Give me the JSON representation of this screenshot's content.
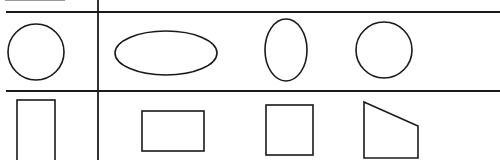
{
  "diagram": {
    "type": "shape-table",
    "colors": {
      "line": "#1a1a1a",
      "background": "#ffffff"
    },
    "grid": {
      "horizontal_lines": [
        {
          "x1": 6,
          "y": 12,
          "x2": 500
        },
        {
          "x1": 6,
          "y": 91,
          "x2": 500
        }
      ],
      "vertical_lines": [
        {
          "x": 98,
          "y1": 0,
          "y2": 160
        }
      ]
    },
    "rows": [
      {
        "name": "round-shapes",
        "shapes": [
          {
            "kind": "circle",
            "cx": 36,
            "cy": 52,
            "r": 28
          },
          {
            "kind": "ellipse-horizontal",
            "cx": 166,
            "cy": 53,
            "rx": 51,
            "ry": 22
          },
          {
            "kind": "ellipse-vertical",
            "cx": 286,
            "cy": 50,
            "rx": 21,
            "ry": 31
          },
          {
            "kind": "circle",
            "cx": 384,
            "cy": 50,
            "r": 28
          }
        ]
      },
      {
        "name": "angular-shapes",
        "shapes": [
          {
            "kind": "rectangle-tall",
            "x": 17,
            "y": 100,
            "w": 38,
            "h": 70
          },
          {
            "kind": "rectangle-wide",
            "x": 142,
            "y": 111,
            "w": 62,
            "h": 40
          },
          {
            "kind": "square",
            "x": 266,
            "y": 105,
            "w": 47,
            "h": 50
          },
          {
            "kind": "trapezoid",
            "points": "364,102 418,126 418,158 364,158"
          }
        ]
      }
    ]
  }
}
